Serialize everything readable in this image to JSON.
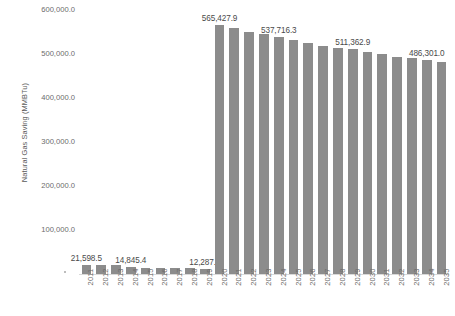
{
  "chart_data": {
    "type": "bar",
    "title": "",
    "xlabel": "",
    "ylabel": "Natural Gas Saving (MMBTu)",
    "ylim": [
      0,
      600000
    ],
    "grid": false,
    "legend": "none",
    "bar_color": "#8C8C8C",
    "categories": [
      "2011",
      "2012",
      "2013",
      "2014",
      "2015",
      "2016",
      "2017",
      "2018",
      "2019",
      "2020",
      "2021",
      "2022",
      "2023",
      "2024",
      "2025",
      "2026",
      "2027",
      "2028",
      "2029",
      "2030",
      "2031",
      "2032",
      "2033",
      "2034",
      "2035"
    ],
    "values": [
      21598.5,
      20800.0,
      19900.0,
      14845.4,
      13900.0,
      13400.0,
      12900.0,
      12600.0,
      12287.3,
      565427.9,
      558000.0,
      551000.0,
      544500.0,
      537716.3,
      531000.0,
      524500.0,
      518000.0,
      514500.0,
      511362.9,
      505000.0,
      500000.0,
      494000.0,
      490500.0,
      486301.0,
      481000.0
    ],
    "ytick_labels": [
      "600,000.0",
      "500,000.0",
      "400,000.0",
      "300,000.0",
      "200,000.0",
      "100,000.0"
    ],
    "ytick_values": [
      600000,
      500000,
      400000,
      300000,
      200000,
      100000
    ],
    "point_labels": [
      {
        "category": "2011",
        "text": "21,598.5"
      },
      {
        "category": "2014",
        "text": "14,845.4"
      },
      {
        "category": "2019",
        "text": "12,287.3"
      },
      {
        "category": "2020",
        "text": "565,427.9"
      },
      {
        "category": "2024",
        "text": "537,716.3"
      },
      {
        "category": "2029",
        "text": "511,362.9"
      },
      {
        "category": "2034",
        "text": "486,301.0"
      }
    ]
  }
}
